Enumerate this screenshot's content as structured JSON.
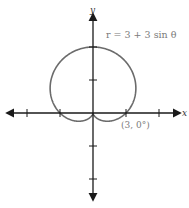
{
  "chart_data": {
    "type": "line",
    "subtype": "polar",
    "title": "",
    "equation_label": "r = 3 + 3 sin θ",
    "point_annotation": "(3, 0°)",
    "xlabel": "x",
    "ylabel": "y",
    "xlim": [
      -8,
      8
    ],
    "ylim": [
      -8,
      8
    ],
    "tick_spacing": 3,
    "grid": false,
    "curve_color": "#6b6b6b",
    "axis_color": "#1a1a1a",
    "function": "r = 3 + 3*sin(theta)",
    "key_points": [
      {
        "theta_deg": 0,
        "r": 3,
        "x": 3,
        "y": 0
      },
      {
        "theta_deg": 90,
        "r": 6,
        "x": 0,
        "y": 6
      },
      {
        "theta_deg": 180,
        "r": 3,
        "x": -3,
        "y": 0
      },
      {
        "theta_deg": 270,
        "r": 0,
        "x": 0,
        "y": 0
      }
    ]
  },
  "labels": {
    "equation": "r = 3 + 3 sin θ",
    "point": "(3, 0°)",
    "x_axis": "x",
    "y_axis": "y"
  }
}
